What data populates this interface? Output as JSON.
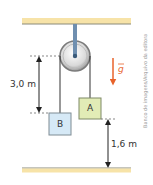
{
  "diagram": {
    "type": "pulley-system",
    "ceiling": {
      "color": "#f7e3a8",
      "edge": "#8a8a7a"
    },
    "floor": {
      "color": "#f7e3a8",
      "edge": "#8a8a7a"
    },
    "pulley": {
      "rod_color": "#6f8fb0",
      "rim_color": "#8a8a8a",
      "fill_color": "#e6e6e6"
    },
    "blocks": [
      {
        "label": "B",
        "fill": "#d6e9f6",
        "border": "#7f8c94"
      },
      {
        "label": "A",
        "fill": "#e2ecb6",
        "border": "#7f8a66"
      }
    ],
    "dimensions": [
      {
        "label": "3,0 m",
        "description": "height difference between pulley level and block B"
      },
      {
        "label": "1,6 m",
        "description": "height of block A above the floor"
      }
    ],
    "gravity": {
      "label": "g",
      "vector": true,
      "color": "#e8632b"
    },
    "credit": "Banco de imagens/Arquivo da editora"
  }
}
